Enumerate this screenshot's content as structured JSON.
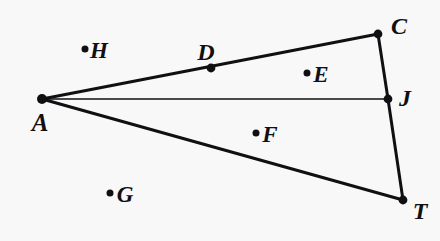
{
  "figure": {
    "kind": "geometry-diagram",
    "canvas": {
      "width": 440,
      "height": 241
    },
    "colors": {
      "background": "#f8f8f9",
      "ink": "#100f12"
    },
    "stroke": {
      "thick_width": 3.0,
      "thin_width": 1.6,
      "dot_radius_on_line": 4.2,
      "dot_radius_free": 3.4
    },
    "points": [
      {
        "id": "A",
        "label": "A",
        "x": 42,
        "y": 99,
        "label_x": 40,
        "label_y": 122,
        "on_figure": true,
        "dot": true,
        "dot_size": "large"
      },
      {
        "id": "C",
        "label": "C",
        "x": 378,
        "y": 34,
        "label_x": 399,
        "label_y": 26,
        "on_figure": true,
        "dot": true,
        "dot_size": "large"
      },
      {
        "id": "J",
        "label": "J",
        "x": 388,
        "y": 99,
        "label_x": 405,
        "label_y": 98,
        "on_figure": true,
        "dot": true,
        "dot_size": "large"
      },
      {
        "id": "T",
        "label": "T",
        "x": 403,
        "y": 200,
        "label_x": 420,
        "label_y": 211,
        "on_figure": true,
        "dot": true,
        "dot_size": "large"
      },
      {
        "id": "D",
        "label": "D",
        "x": 211,
        "y": 68,
        "label_x": 206,
        "label_y": 52,
        "on_figure": true,
        "dot": true,
        "dot_size": "large"
      },
      {
        "id": "E",
        "label": "E",
        "x": 307,
        "y": 73,
        "label_x": 321,
        "label_y": 74,
        "on_figure": false,
        "dot": true,
        "dot_size": "small"
      },
      {
        "id": "F",
        "label": "F",
        "x": 256,
        "y": 133,
        "label_x": 270,
        "label_y": 134,
        "on_figure": false,
        "dot": true,
        "dot_size": "small"
      },
      {
        "id": "G",
        "label": "G",
        "x": 110,
        "y": 193,
        "label_x": 125,
        "label_y": 194,
        "on_figure": false,
        "dot": true,
        "dot_size": "small"
      },
      {
        "id": "H",
        "label": "H",
        "x": 85,
        "y": 49,
        "label_x": 99,
        "label_y": 50,
        "on_figure": false,
        "dot": true,
        "dot_size": "small"
      }
    ],
    "segments": [
      {
        "id": "A-C",
        "from": "A",
        "to": "C",
        "x1": 42,
        "y1": 99,
        "x2": 378,
        "y2": 34,
        "weight": "thick"
      },
      {
        "id": "C-J",
        "from": "C",
        "to": "J",
        "x1": 378,
        "y1": 34,
        "x2": 388,
        "y2": 99,
        "weight": "thick"
      },
      {
        "id": "J-T",
        "from": "J",
        "to": "T",
        "x1": 388,
        "y1": 99,
        "x2": 403,
        "y2": 200,
        "weight": "thick"
      },
      {
        "id": "A-T",
        "from": "A",
        "to": "T",
        "x1": 42,
        "y1": 99,
        "x2": 403,
        "y2": 200,
        "weight": "thick"
      },
      {
        "id": "A-J",
        "from": "A",
        "to": "J",
        "x1": 42,
        "y1": 99,
        "x2": 388,
        "y2": 99,
        "weight": "thin"
      }
    ]
  }
}
